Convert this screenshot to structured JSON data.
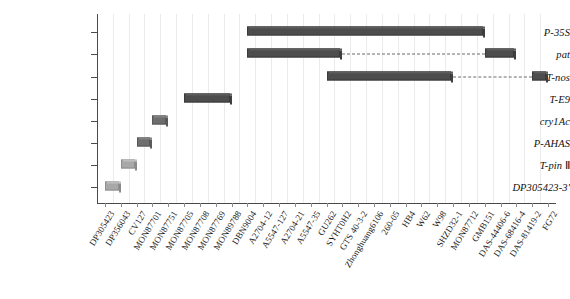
{
  "figure": {
    "type": "gantt-style-presence-chart",
    "background": "#ffffff",
    "bar_color_dark": "#4d4d4d",
    "bar_color_light": "#a8a8a8",
    "grid_color": "#ebebeb",
    "axis_color": "#4a4a4a"
  },
  "chart_data": {
    "type": "bar",
    "title": "",
    "xlabel": "",
    "ylabel": "",
    "grid": true,
    "legend": null,
    "orientation": "horizontal-range",
    "categories": [
      "DP305423",
      "DP356043",
      "CV127",
      "MON87701",
      "MON87751",
      "MON87705",
      "MON87708",
      "MON87769",
      "MON89788",
      "DBN9004",
      "A2704-12",
      "A5547-127",
      "A2704-21",
      "A5547-35",
      "GU262",
      "SYHT0H2",
      "GTS 40-3-2",
      "Zhonghuang6106",
      "260-05",
      "HB4",
      "W62",
      "W98",
      "SHZD32-1",
      "MON87712",
      "GMB151",
      "DAS-44406-6",
      "DAS-68416-4",
      "DAS-81419-2",
      "FG72"
    ],
    "yaxis_categories": [
      "DP305423-3'",
      "T-pin Ⅱ",
      "P-AHAS",
      "cry1Ac",
      "T-E9",
      "T-nos",
      "pat",
      "P-35S"
    ],
    "series": [
      {
        "name": "P-35S",
        "row": 7,
        "shade": "dark",
        "segments": [
          {
            "start_index": 9,
            "end_index": 24,
            "start_label": "DBN9004",
            "end_label": "GMB151"
          }
        ]
      },
      {
        "name": "pat",
        "row": 6,
        "shade": "dark",
        "segments": [
          {
            "start_index": 9,
            "end_index": 15,
            "start_label": "DBN9004",
            "end_label": "SYHT0H2"
          },
          {
            "start_index": 24,
            "end_index": 26,
            "start_label": "GMB151",
            "end_label": "DAS-68416-4"
          }
        ],
        "connectors": [
          {
            "from_index": 15,
            "to_index": 24
          }
        ]
      },
      {
        "name": "T-nos",
        "row": 5,
        "shade": "dark",
        "segments": [
          {
            "start_index": 14,
            "end_index": 22,
            "start_label": "GU262",
            "end_label": "SHZD32-1"
          },
          {
            "start_index": 27,
            "end_index": 28,
            "start_label": "DAS-81419-2",
            "end_label": "FG72"
          }
        ],
        "connectors": [
          {
            "from_index": 22,
            "to_index": 27
          }
        ]
      },
      {
        "name": "T-E9",
        "row": 4,
        "shade": "dark",
        "segments": [
          {
            "start_index": 5,
            "end_index": 8,
            "start_label": "MON87705",
            "end_label": "MON89788"
          }
        ]
      },
      {
        "name": "cry1Ac",
        "row": 3,
        "shade": "mid",
        "segments": [
          {
            "start_index": 3,
            "end_index": 4,
            "start_label": "MON87701",
            "end_label": "MON87751"
          }
        ]
      },
      {
        "name": "P-AHAS",
        "row": 2,
        "shade": "mid",
        "segments": [
          {
            "start_index": 2,
            "end_index": 3,
            "start_label": "CV127",
            "end_label": "MON87701"
          }
        ]
      },
      {
        "name": "T-pin Ⅱ",
        "row": 1,
        "shade": "light",
        "segments": [
          {
            "start_index": 1,
            "end_index": 2,
            "start_label": "DP356043",
            "end_label": "CV127"
          }
        ]
      },
      {
        "name": "DP305423-3'",
        "row": 0,
        "shade": "light",
        "segments": [
          {
            "start_index": 0,
            "end_index": 1,
            "start_label": "DP305423",
            "end_label": "DP356043"
          }
        ]
      }
    ]
  }
}
